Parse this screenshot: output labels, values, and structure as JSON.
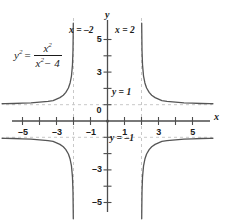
{
  "chart_data": {
    "type": "line",
    "title": "",
    "equation_text": "y^2 = x^2/(x^2-4)",
    "equation": {
      "lhs_base": "y",
      "lhs_exp": "2",
      "equals": "=",
      "num_base": "x",
      "num_exp": "2",
      "den_base": "x",
      "den_exp": "2",
      "den_rest": "− 4"
    },
    "xlabel": "x",
    "ylabel": "y",
    "xlim": [
      -6.2,
      6.2
    ],
    "ylim": [
      -6.0,
      6.0
    ],
    "grid": false,
    "legend": "none",
    "x_ticks": [
      -5,
      -4,
      -3,
      -2,
      -1,
      1,
      2,
      3,
      4,
      5
    ],
    "x_tick_labels": [
      {
        "value": -5,
        "label": "–5"
      },
      {
        "value": -3,
        "label": "–3"
      },
      {
        "value": -1,
        "label": "–1"
      },
      {
        "value": 1,
        "label": "1"
      },
      {
        "value": 3,
        "label": "3"
      },
      {
        "value": 5,
        "label": "5"
      }
    ],
    "y_ticks": [
      -5,
      -4,
      -3,
      -2,
      -1,
      1,
      2,
      3,
      4,
      5
    ],
    "y_tick_labels": [
      {
        "value": 5,
        "label": "5"
      },
      {
        "value": 3,
        "label": "3"
      },
      {
        "value": 0,
        "label": "0"
      },
      {
        "value": -3,
        "label": "–3"
      },
      {
        "value": -5,
        "label": "–5"
      }
    ],
    "asymptotes": {
      "vertical": [
        {
          "x": -2,
          "label": "x = –2"
        },
        {
          "x": 2,
          "label": "x = 2"
        }
      ],
      "horizontal": [
        {
          "y": 1,
          "label": "y = 1"
        },
        {
          "y": -1,
          "label": "y = –1"
        }
      ]
    },
    "series": [
      {
        "name": "upper-left-branch",
        "comment": "y = +sqrt(x^2/(x^2-4)) for x < -2",
        "points": [
          [
            -6.2,
            1.057
          ],
          [
            -6.0,
            1.061
          ],
          [
            -5.5,
            1.074
          ],
          [
            -5.0,
            1.091
          ],
          [
            -4.5,
            1.115
          ],
          [
            -4.0,
            1.155
          ],
          [
            -3.5,
            1.206
          ],
          [
            -3.2,
            1.252
          ],
          [
            -3.0,
            1.342
          ],
          [
            -2.8,
            1.434
          ],
          [
            -2.6,
            1.581
          ],
          [
            -2.45,
            1.756
          ],
          [
            -2.3,
            2.024
          ],
          [
            -2.2,
            2.333
          ],
          [
            -2.12,
            2.754
          ],
          [
            -2.06,
            3.446
          ],
          [
            -2.03,
            4.343
          ],
          [
            -2.018,
            5.35
          ],
          [
            -2.012,
            6.0
          ]
        ]
      },
      {
        "name": "upper-right-branch",
        "comment": "y = +sqrt(x^2/(x^2-4)) for x > 2",
        "points": [
          [
            2.012,
            6.0
          ],
          [
            2.018,
            5.35
          ],
          [
            2.03,
            4.343
          ],
          [
            2.06,
            3.446
          ],
          [
            2.12,
            2.754
          ],
          [
            2.2,
            2.333
          ],
          [
            2.3,
            2.024
          ],
          [
            2.45,
            1.756
          ],
          [
            2.6,
            1.581
          ],
          [
            2.8,
            1.434
          ],
          [
            3.0,
            1.342
          ],
          [
            3.2,
            1.252
          ],
          [
            3.5,
            1.206
          ],
          [
            4.0,
            1.155
          ],
          [
            4.5,
            1.115
          ],
          [
            5.0,
            1.091
          ],
          [
            5.5,
            1.074
          ],
          [
            6.0,
            1.061
          ],
          [
            6.2,
            1.057
          ]
        ]
      },
      {
        "name": "lower-left-branch",
        "comment": "y = -sqrt(x^2/(x^2-4)) for x < -2",
        "points": [
          [
            -6.2,
            -1.057
          ],
          [
            -6.0,
            -1.061
          ],
          [
            -5.5,
            -1.074
          ],
          [
            -5.0,
            -1.091
          ],
          [
            -4.5,
            -1.115
          ],
          [
            -4.0,
            -1.155
          ],
          [
            -3.5,
            -1.206
          ],
          [
            -3.2,
            -1.252
          ],
          [
            -3.0,
            -1.342
          ],
          [
            -2.8,
            -1.434
          ],
          [
            -2.6,
            -1.581
          ],
          [
            -2.45,
            -1.756
          ],
          [
            -2.3,
            -2.024
          ],
          [
            -2.2,
            -2.333
          ],
          [
            -2.12,
            -2.754
          ],
          [
            -2.06,
            -3.446
          ],
          [
            -2.03,
            -4.343
          ],
          [
            -2.018,
            -5.35
          ],
          [
            -2.012,
            -6.0
          ]
        ]
      },
      {
        "name": "lower-right-branch",
        "comment": "y = -sqrt(x^2/(x^2-4)) for x > 2",
        "points": [
          [
            2.012,
            -6.0
          ],
          [
            2.018,
            -5.35
          ],
          [
            2.03,
            -4.343
          ],
          [
            2.06,
            -3.446
          ],
          [
            2.12,
            -2.754
          ],
          [
            2.2,
            -2.333
          ],
          [
            2.3,
            -2.024
          ],
          [
            2.45,
            -1.756
          ],
          [
            2.6,
            -1.581
          ],
          [
            2.8,
            -1.434
          ],
          [
            3.0,
            -1.342
          ],
          [
            3.2,
            -1.252
          ],
          [
            3.5,
            -1.206
          ],
          [
            4.0,
            -1.155
          ],
          [
            4.5,
            -1.115
          ],
          [
            5.0,
            -1.091
          ],
          [
            5.5,
            -1.074
          ],
          [
            6.0,
            -1.061
          ],
          [
            6.2,
            -1.057
          ]
        ]
      }
    ],
    "colors": {
      "curve": "#555555",
      "axis": "#4d4d4d",
      "asymptote": "#c8c8c8",
      "text": "#1a1a1a"
    }
  },
  "labels": {
    "vertical_asymptote_left": "x = –2",
    "vertical_asymptote_right": "x = 2",
    "horizontal_asymptote_upper": "y = 1",
    "horizontal_asymptote_lower": "y = –1",
    "origin": "0",
    "x_axis_name": "x",
    "y_axis_name": "y"
  }
}
